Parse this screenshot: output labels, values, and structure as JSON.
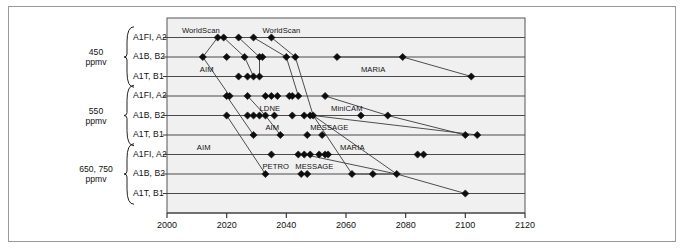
{
  "chart_data": {
    "type": "scatter",
    "title": "",
    "xlabel": "",
    "ylabel": "",
    "xlim": [
      2000,
      2120
    ],
    "xticks": [
      2000,
      2020,
      2040,
      2060,
      2080,
      2100,
      2120
    ],
    "xtick_labels": [
      "2000",
      "2020",
      "2040",
      "2060",
      "2080",
      "2100",
      "2120"
    ],
    "grid": "horizontal",
    "legend": "none",
    "y_groups": [
      {
        "group_label_line1": "450",
        "group_label_line2": "ppmv",
        "categories": [
          "A1FI, A2",
          "A1B, B2",
          "A1T, B1"
        ]
      },
      {
        "group_label_line1": "550",
        "group_label_line2": "ppmv",
        "categories": [
          "A1FI, A2",
          "A1B, B2",
          "A1T, B1"
        ]
      },
      {
        "group_label_line1": "650, 750",
        "group_label_line2": "ppmv",
        "categories": [
          "A1FI, A2",
          "A1B, B2",
          "A1T, B1"
        ]
      }
    ],
    "rows": [
      {
        "row": 0,
        "group": "450 ppmv",
        "category": "A1FI, A2",
        "values": [
          2017,
          2019,
          2024,
          2029,
          2035
        ]
      },
      {
        "row": 1,
        "group": "450 ppmv",
        "category": "A1B, B2",
        "values": [
          2012,
          2020,
          2026,
          2031,
          2032,
          2040,
          2043,
          2057,
          2079
        ]
      },
      {
        "row": 2,
        "group": "450 ppmv",
        "category": "A1T, B1",
        "values": [
          2024,
          2027,
          2029,
          2031,
          2102
        ]
      },
      {
        "row": 3,
        "group": "550 ppmv",
        "category": "A1FI, A2",
        "values": [
          2020,
          2021,
          2027,
          2033,
          2035,
          2037,
          2041,
          2042,
          2044,
          2053
        ]
      },
      {
        "row": 4,
        "group": "550 ppmv",
        "category": "A1B, B2",
        "values": [
          2020,
          2027,
          2029,
          2031,
          2033,
          2036,
          2042,
          2046,
          2048,
          2049,
          2065,
          2074
        ]
      },
      {
        "row": 5,
        "group": "550 ppmv",
        "category": "A1T, B1",
        "values": [
          2029,
          2038,
          2047,
          2052,
          2100,
          2104
        ]
      },
      {
        "row": 6,
        "group": "650, 750 ppmv",
        "category": "A1FI, A2",
        "values": [
          2035,
          2044,
          2046,
          2048,
          2051,
          2053,
          2054,
          2084,
          2086
        ]
      },
      {
        "row": 7,
        "group": "650, 750 ppmv",
        "category": "A1B, B2",
        "values": [
          2033,
          2045,
          2047,
          2062,
          2069,
          2077
        ]
      },
      {
        "row": 8,
        "group": "650, 750 ppmv",
        "category": "A1T, B1",
        "values": [
          2100
        ]
      }
    ],
    "annotations": [
      {
        "text": "WorldScan",
        "x": 2005,
        "row": 0
      },
      {
        "text": "WorldScan",
        "x": 2032,
        "row": 0
      },
      {
        "text": "AIM",
        "x": 2011,
        "row": 2
      },
      {
        "text": "MARIA",
        "x": 2065,
        "row": 2
      },
      {
        "text": "LDNE",
        "x": 2031,
        "row": 4
      },
      {
        "text": "MiniCAM",
        "x": 2055,
        "row": 4
      },
      {
        "text": "AIM",
        "x": 2033,
        "row": 5
      },
      {
        "text": "MESSAGE",
        "x": 2048,
        "row": 5
      },
      {
        "text": "AIM",
        "x": 2010,
        "row": 6
      },
      {
        "text": "MARIA",
        "x": 2058,
        "row": 6
      },
      {
        "text": "PETRO",
        "x": 2032,
        "row": 7
      },
      {
        "text": "MESSAGE",
        "x": 2043,
        "row": 7
      }
    ],
    "connectors": [
      {
        "name": "WorldScan-450-top",
        "points": [
          [
            2017,
            0
          ],
          [
            2012,
            1
          ]
        ]
      },
      {
        "name": "WorldScan-chain-a",
        "points": [
          [
            2019,
            0
          ],
          [
            2026,
            1
          ],
          [
            2029,
            2
          ]
        ]
      },
      {
        "name": "WorldScan-chain-b",
        "points": [
          [
            2024,
            0
          ],
          [
            2031,
            1
          ],
          [
            2031,
            2
          ]
        ]
      },
      {
        "name": "WorldScan-chain-c",
        "points": [
          [
            2029,
            0
          ],
          [
            2040,
            1
          ],
          [
            2044,
            3
          ]
        ]
      },
      {
        "name": "WorldScan-chain-d",
        "points": [
          [
            2035,
            0
          ],
          [
            2043,
            1
          ],
          [
            2049,
            4
          ]
        ]
      },
      {
        "name": "MARIA-450",
        "points": [
          [
            2057,
            1
          ],
          [
            2079,
            1
          ],
          [
            2102,
            2
          ]
        ]
      },
      {
        "name": "AIM-450",
        "points": [
          [
            2012,
            1
          ],
          [
            2021,
            3
          ]
        ]
      },
      {
        "name": "AIM-550",
        "points": [
          [
            2020,
            3
          ],
          [
            2029,
            5
          ]
        ]
      },
      {
        "name": "LDNE-chain",
        "points": [
          [
            2027,
            3
          ],
          [
            2033,
            4
          ],
          [
            2038,
            5
          ]
        ]
      },
      {
        "name": "AIM-650",
        "points": [
          [
            2020,
            4
          ],
          [
            2033,
            7
          ]
        ]
      },
      {
        "name": "MiniCAM-550",
        "points": [
          [
            2053,
            3
          ],
          [
            2074,
            4
          ],
          [
            2100,
            5
          ]
        ]
      },
      {
        "name": "MESSAGE-550",
        "points": [
          [
            2049,
            4
          ],
          [
            2104,
            5
          ]
        ]
      },
      {
        "name": "MARIA-650",
        "points": [
          [
            2049,
            4
          ],
          [
            2077,
            7
          ]
        ]
      },
      {
        "name": "MESSAGE-650",
        "points": [
          [
            2049,
            4
          ],
          [
            2062,
            7
          ],
          [
            2077,
            7
          ]
        ]
      },
      {
        "name": "PETRO-drop",
        "points": [
          [
            2046,
            6
          ],
          [
            2077,
            7
          ],
          [
            2100,
            8
          ]
        ]
      }
    ]
  }
}
